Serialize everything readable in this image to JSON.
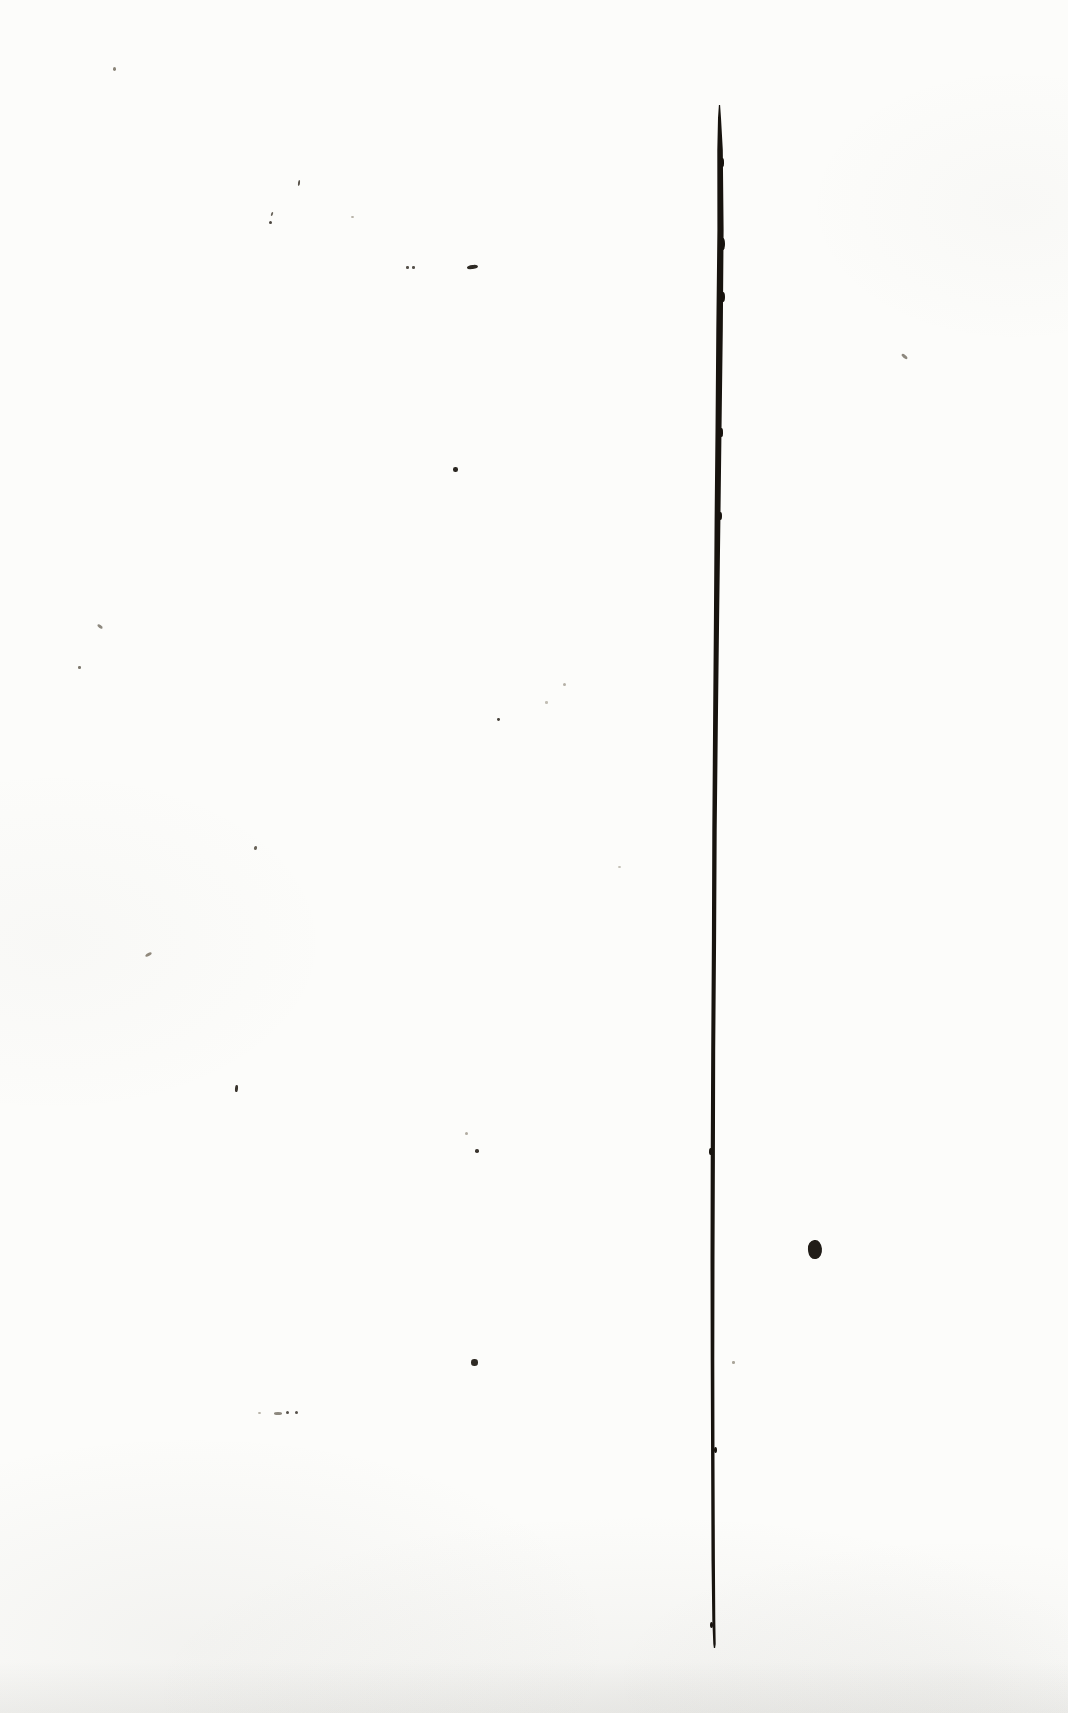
{
  "document": {
    "kind": "scanned-blank-book-page",
    "visible_text": "",
    "page_background": "#fcfcfa",
    "ink_color": "#17130e"
  },
  "gutter_line": {
    "color": "#17130e",
    "top_y": 105,
    "bottom_y": 1648,
    "points": [
      {
        "y": 105,
        "x": 719.5,
        "w": 1.2
      },
      {
        "y": 118,
        "x": 719.5,
        "w": 3.0
      },
      {
        "y": 150,
        "x": 720.0,
        "w": 5.5
      },
      {
        "y": 230,
        "x": 720.5,
        "w": 6.2
      },
      {
        "y": 330,
        "x": 719.5,
        "w": 6.5
      },
      {
        "y": 430,
        "x": 718.5,
        "w": 6.0
      },
      {
        "y": 520,
        "x": 717.5,
        "w": 5.8
      },
      {
        "y": 620,
        "x": 716.5,
        "w": 5.2
      },
      {
        "y": 720,
        "x": 715.5,
        "w": 4.8
      },
      {
        "y": 830,
        "x": 714.5,
        "w": 4.4
      },
      {
        "y": 940,
        "x": 714.0,
        "w": 4.2
      },
      {
        "y": 1050,
        "x": 713.2,
        "w": 4.0
      },
      {
        "y": 1160,
        "x": 712.8,
        "w": 4.2
      },
      {
        "y": 1260,
        "x": 712.5,
        "w": 4.0
      },
      {
        "y": 1360,
        "x": 712.5,
        "w": 3.6
      },
      {
        "y": 1460,
        "x": 712.8,
        "w": 3.4
      },
      {
        "y": 1560,
        "x": 713.2,
        "w": 3.4
      },
      {
        "y": 1620,
        "x": 713.8,
        "w": 3.0
      },
      {
        "y": 1644,
        "x": 714.5,
        "w": 2.4
      },
      {
        "y": 1648,
        "x": 714.5,
        "w": 1.2
      }
    ],
    "edge_bumps": [
      {
        "x": 722.5,
        "y": 158,
        "w": 3.5,
        "h": 9
      },
      {
        "x": 723.0,
        "y": 238,
        "w": 3.5,
        "h": 12
      },
      {
        "x": 722.5,
        "y": 292,
        "w": 4.0,
        "h": 10
      },
      {
        "x": 721.5,
        "y": 428,
        "w": 3.5,
        "h": 9
      },
      {
        "x": 720.0,
        "y": 512,
        "w": 3.0,
        "h": 8
      },
      {
        "x": 716.5,
        "y": 642,
        "w": 3.0,
        "h": 8
      },
      {
        "x": 714.5,
        "y": 902,
        "w": 2.8,
        "h": 7
      },
      {
        "x": 710.5,
        "y": 1148,
        "w": 3.0,
        "h": 7
      },
      {
        "x": 715.0,
        "y": 1447,
        "w": 3.0,
        "h": 6
      },
      {
        "x": 711.0,
        "y": 1622,
        "w": 3.0,
        "h": 6
      }
    ]
  },
  "specks": [
    {
      "x": 113,
      "y": 67,
      "w": 3,
      "h": 3.5,
      "color": "#8a8478",
      "rot": 0,
      "blob": false
    },
    {
      "x": 298,
      "y": 180,
      "w": 2,
      "h": 6,
      "color": "#5a554c",
      "rot": 8,
      "blob": false
    },
    {
      "x": 271,
      "y": 212,
      "w": 2,
      "h": 4,
      "color": "#6a655c",
      "rot": 20,
      "blob": false
    },
    {
      "x": 269,
      "y": 221,
      "w": 3,
      "h": 3,
      "color": "#4a453e",
      "rot": 0,
      "blob": false
    },
    {
      "x": 351,
      "y": 216,
      "w": 3,
      "h": 2,
      "color": "#b5b0a6",
      "rot": 0,
      "blob": false
    },
    {
      "x": 406,
      "y": 266,
      "w": 2.5,
      "h": 2.5,
      "color": "#55504a",
      "rot": 0,
      "blob": false
    },
    {
      "x": 412,
      "y": 266,
      "w": 2.5,
      "h": 2.5,
      "color": "#55504a",
      "rot": 0,
      "blob": false
    },
    {
      "x": 467,
      "y": 265,
      "w": 11,
      "h": 4,
      "color": "#2e2a24",
      "rot": -6,
      "blob": true
    },
    {
      "x": 453,
      "y": 467,
      "w": 4.5,
      "h": 4.5,
      "color": "#2a2620",
      "rot": 0,
      "blob": false
    },
    {
      "x": 901,
      "y": 355,
      "w": 7,
      "h": 3,
      "color": "#8d887e",
      "rot": 40,
      "blob": false
    },
    {
      "x": 97,
      "y": 625,
      "w": 6,
      "h": 3,
      "color": "#8d887e",
      "rot": 35,
      "blob": false
    },
    {
      "x": 78,
      "y": 666,
      "w": 2.5,
      "h": 2.5,
      "color": "#7d786e",
      "rot": 0,
      "blob": false
    },
    {
      "x": 563,
      "y": 683,
      "w": 3,
      "h": 3,
      "color": "#b5b0a6",
      "rot": 0,
      "blob": false
    },
    {
      "x": 545,
      "y": 701,
      "w": 2.5,
      "h": 2.5,
      "color": "#c2beb4",
      "rot": 0,
      "blob": false
    },
    {
      "x": 497,
      "y": 718,
      "w": 2.8,
      "h": 2.8,
      "color": "#47423b",
      "rot": 0,
      "blob": false
    },
    {
      "x": 254,
      "y": 846,
      "w": 3,
      "h": 4,
      "color": "#6a645a",
      "rot": 15,
      "blob": false
    },
    {
      "x": 618,
      "y": 866,
      "w": 3,
      "h": 2,
      "color": "#c2beb4",
      "rot": 0,
      "blob": false
    },
    {
      "x": 145,
      "y": 953,
      "w": 7,
      "h": 3,
      "color": "#90897c",
      "rot": -30,
      "blob": false
    },
    {
      "x": 235,
      "y": 1085,
      "w": 2.5,
      "h": 7,
      "color": "#3a352e",
      "rot": 5,
      "blob": false
    },
    {
      "x": 465,
      "y": 1132,
      "w": 3,
      "h": 3,
      "color": "#b0aba0",
      "rot": 0,
      "blob": false
    },
    {
      "x": 475,
      "y": 1149,
      "w": 3.5,
      "h": 3.5,
      "color": "#3a352e",
      "rot": 0,
      "blob": false
    },
    {
      "x": 808,
      "y": 1240,
      "w": 14,
      "h": 19,
      "color": "#211d18",
      "rot": -6,
      "blob": true
    },
    {
      "x": 471,
      "y": 1359,
      "w": 6.5,
      "h": 6.5,
      "color": "#2e2a24",
      "rot": 0,
      "blob": false
    },
    {
      "x": 732,
      "y": 1361,
      "w": 2.5,
      "h": 2.5,
      "color": "#aaa59a",
      "rot": 0,
      "blob": false
    },
    {
      "x": 258,
      "y": 1412,
      "w": 3,
      "h": 2,
      "color": "#b5b0a6",
      "rot": 0,
      "blob": false
    },
    {
      "x": 274,
      "y": 1412,
      "w": 8,
      "h": 2.5,
      "color": "#8d887e",
      "rot": 0,
      "blob": false
    },
    {
      "x": 286,
      "y": 1411,
      "w": 3,
      "h": 3,
      "color": "#55504a",
      "rot": 0,
      "blob": false
    },
    {
      "x": 295,
      "y": 1411,
      "w": 3,
      "h": 3,
      "color": "#55504a",
      "rot": 0,
      "blob": false
    }
  ]
}
